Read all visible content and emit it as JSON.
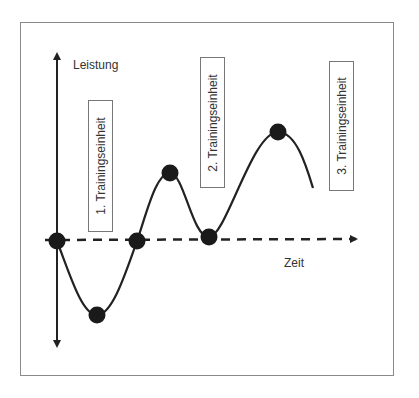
{
  "diagram": {
    "y_axis_label": "Leistung",
    "x_axis_label": "Zeit",
    "boxes": [
      {
        "label": "1. Trainingseinheit"
      },
      {
        "label": "2. Trainingseinheit"
      },
      {
        "label": "3. Trainingseinheit"
      }
    ],
    "colors": {
      "curve": "#222222",
      "points": "#1a1a1a",
      "frame": "#8a8a8a",
      "box_border": "#777777",
      "text": "#333333"
    },
    "points": [
      {
        "name": "start",
        "x": 57,
        "y": 241
      },
      {
        "name": "trough",
        "x": 97,
        "y": 315
      },
      {
        "name": "baseline-cross-1",
        "x": 137,
        "y": 241
      },
      {
        "name": "peak-1",
        "x": 170,
        "y": 173
      },
      {
        "name": "baseline-cross-2",
        "x": 209,
        "y": 237
      },
      {
        "name": "peak-2",
        "x": 278,
        "y": 132
      }
    ]
  }
}
